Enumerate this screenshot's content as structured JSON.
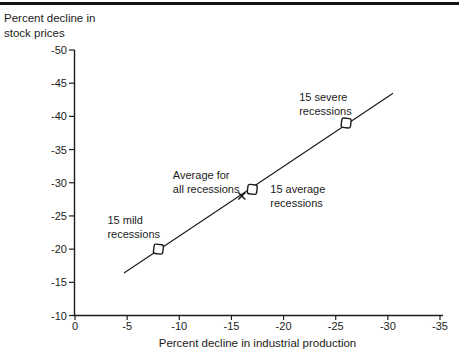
{
  "page": {
    "background": "#ffffff",
    "ink": "#1c1c1c",
    "rule_color": "#141414"
  },
  "chart_data": {
    "type": "scatter",
    "title": "",
    "xlabel": "Percent decline in industrial production",
    "ylabel": "Percent decline in\nstock prices",
    "x_tick_values": [
      0,
      -5,
      -10,
      -15,
      -20,
      -25,
      -30,
      -35
    ],
    "y_tick_values": [
      -50,
      -45,
      -40,
      -35,
      -30,
      -25,
      -20,
      -15,
      -10
    ],
    "xlim": [
      0,
      -35
    ],
    "ylim": [
      -10,
      -50
    ],
    "grid": false,
    "legend": "none",
    "points": [
      {
        "label": "15 mild\nrecessions",
        "x": -8,
        "y": -20,
        "marker": "open-square",
        "label_dx": -51,
        "label_dy": -25,
        "label_align": "start"
      },
      {
        "label": "15 average\nrecessions",
        "x": -17,
        "y": -29,
        "marker": "open-square",
        "label_dx": 18,
        "label_dy": 4,
        "label_align": "start"
      },
      {
        "label": "15 severe\nrecessions",
        "x": -26,
        "y": -39,
        "marker": "open-square",
        "label_dx": -47,
        "label_dy": -22,
        "label_align": "start"
      },
      {
        "label": "Average for\nall recessions",
        "x": -16,
        "y": -28,
        "marker": "x",
        "label_dx": -69,
        "label_dy": -17,
        "label_align": "start"
      }
    ],
    "trend_line": {
      "x1": -4.7,
      "y1": -16.4,
      "x2": -30.5,
      "y2": -43.5
    }
  }
}
